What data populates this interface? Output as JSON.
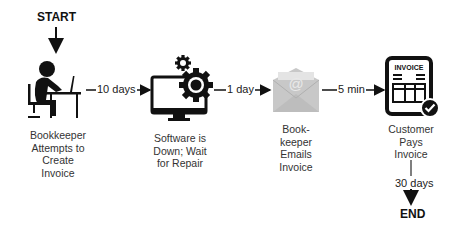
{
  "diagram": {
    "start_label": "START",
    "end_label": "END",
    "nodes": [
      {
        "id": "bookkeeper",
        "icon": "person-at-desk-icon",
        "label_lines": [
          "Bookkeeper",
          "Attempts to",
          "Create",
          "Invoice"
        ]
      },
      {
        "id": "software",
        "icon": "monitor-gears-icon",
        "label_lines": [
          "Software is",
          "Down; Wait",
          "for Repair"
        ]
      },
      {
        "id": "email",
        "icon": "email-envelope-icon",
        "icon_text": "@",
        "label_lines": [
          "Book-",
          "keeper",
          "Emails",
          "Invoice"
        ]
      },
      {
        "id": "customer",
        "icon": "invoice-check-icon",
        "icon_text": "INVOICE",
        "label_lines": [
          "Customer",
          "Pays",
          "Invoice"
        ]
      }
    ],
    "edges": [
      {
        "from": "start",
        "to": "bookkeeper",
        "label": ""
      },
      {
        "from": "bookkeeper",
        "to": "software",
        "label": "10 days"
      },
      {
        "from": "software",
        "to": "email",
        "label": "1 day"
      },
      {
        "from": "email",
        "to": "customer",
        "label": "5 min"
      },
      {
        "from": "customer",
        "to": "end",
        "label": "30 days"
      }
    ],
    "colors": {
      "ink": "#111111",
      "email_gray": "#c8c8c8",
      "text": "#333333"
    }
  }
}
